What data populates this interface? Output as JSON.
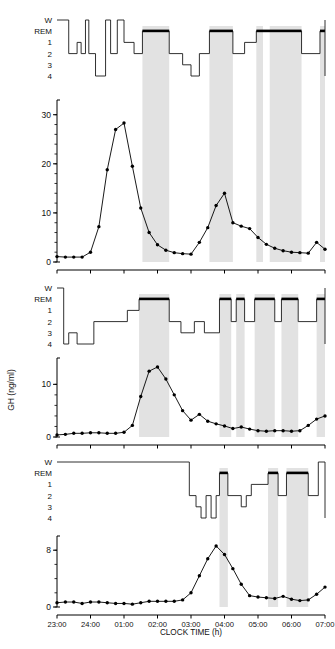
{
  "figure": {
    "xlabel": "CLOCK TIME (h)",
    "ylabel": "GH (ng/ml)",
    "x_ticks": [
      "23:00",
      "24:00",
      "01:00",
      "02:00",
      "03:00",
      "04:00",
      "05:00",
      "06:00",
      "07:00"
    ],
    "hypnogram_stage_labels": [
      "W",
      "REM",
      "1",
      "2",
      "3",
      "4"
    ],
    "colors": {
      "line": "#000000",
      "marker": "#000000",
      "rem_bar": "#000000",
      "rem_band": "#e2e2e2",
      "axis": "#000000"
    }
  },
  "chart_data": [
    {
      "type": "line",
      "title": "Subject 1 — GH and sleep stages",
      "panel": 1,
      "xlabel": "CLOCK TIME (h)",
      "ylabel": "GH (ng/ml)",
      "xlim": [
        23.0,
        31.0
      ],
      "ylim": [
        0,
        33
      ],
      "yticks": [
        0,
        10,
        20,
        30
      ],
      "ytick_labels": [
        "0",
        "10",
        "20",
        "30"
      ],
      "minor_ytick_step": 2,
      "grid": false,
      "legend": "none",
      "x": [
        23.0,
        23.25,
        23.5,
        23.75,
        24.0,
        24.25,
        24.5,
        24.75,
        25.0,
        25.25,
        25.5,
        25.75,
        26.0,
        26.25,
        26.5,
        26.75,
        27.0,
        27.25,
        27.5,
        27.75,
        28.0,
        28.25,
        28.5,
        28.75,
        29.0,
        29.25,
        29.5,
        29.75,
        30.0,
        30.25,
        30.5,
        30.75,
        31.0
      ],
      "values": [
        1.1,
        1.0,
        1.0,
        1.0,
        2.0,
        7.2,
        18.8,
        27.0,
        28.3,
        19.5,
        11.0,
        6.0,
        3.5,
        2.4,
        1.9,
        1.7,
        1.6,
        4.0,
        7.0,
        11.5,
        14.0,
        8.0,
        7.3,
        6.8,
        5.0,
        3.6,
        2.8,
        2.3,
        2.0,
        1.9,
        1.8,
        4.0,
        2.6
      ],
      "rem_bands": [
        [
          25.55,
          26.35
        ],
        [
          27.55,
          28.25
        ],
        [
          28.95,
          29.15
        ],
        [
          29.35,
          30.3
        ],
        [
          30.85,
          31.0
        ]
      ],
      "hypnogram": {
        "stages": [
          "W",
          "REM",
          "1",
          "2",
          "3",
          "4"
        ],
        "segments": [
          {
            "t0": 23.0,
            "t1": 23.35,
            "stage": "W"
          },
          {
            "t0": 23.35,
            "t1": 23.6,
            "stage": "2"
          },
          {
            "t0": 23.6,
            "t1": 23.72,
            "stage": "1"
          },
          {
            "t0": 23.72,
            "t1": 23.85,
            "stage": "2"
          },
          {
            "t0": 23.85,
            "t1": 23.95,
            "stage": "W"
          },
          {
            "t0": 23.95,
            "t1": 24.15,
            "stage": "2"
          },
          {
            "t0": 24.15,
            "t1": 24.45,
            "stage": "4"
          },
          {
            "t0": 24.45,
            "t1": 24.6,
            "stage": "W"
          },
          {
            "t0": 24.6,
            "t1": 24.8,
            "stage": "2"
          },
          {
            "t0": 24.8,
            "t1": 25.0,
            "stage": "W"
          },
          {
            "t0": 25.0,
            "t1": 25.3,
            "stage": "1"
          },
          {
            "t0": 25.3,
            "t1": 25.55,
            "stage": "2"
          },
          {
            "t0": 25.55,
            "t1": 26.35,
            "stage": "REM"
          },
          {
            "t0": 26.35,
            "t1": 26.75,
            "stage": "2"
          },
          {
            "t0": 26.75,
            "t1": 27.0,
            "stage": "3"
          },
          {
            "t0": 27.0,
            "t1": 27.25,
            "stage": "4"
          },
          {
            "t0": 27.25,
            "t1": 27.55,
            "stage": "2"
          },
          {
            "t0": 27.55,
            "t1": 28.25,
            "stage": "REM"
          },
          {
            "t0": 28.25,
            "t1": 28.6,
            "stage": "2"
          },
          {
            "t0": 28.6,
            "t1": 28.95,
            "stage": "1"
          },
          {
            "t0": 28.95,
            "t1": 30.3,
            "stage": "REM"
          },
          {
            "t0": 30.3,
            "t1": 30.85,
            "stage": "2"
          },
          {
            "t0": 30.85,
            "t1": 31.0,
            "stage": "REM"
          }
        ]
      }
    },
    {
      "type": "line",
      "title": "Subject 2 — GH and sleep stages",
      "panel": 2,
      "xlabel": "CLOCK TIME (h)",
      "ylabel": "GH (ng/ml)",
      "xlim": [
        23.0,
        31.0
      ],
      "ylim": [
        0,
        15
      ],
      "yticks": [
        0,
        10
      ],
      "ytick_labels": [
        "0",
        "10"
      ],
      "minor_ytick_step": 2,
      "grid": false,
      "legend": "none",
      "x": [
        23.0,
        23.25,
        23.5,
        23.75,
        24.0,
        24.25,
        24.5,
        24.75,
        25.0,
        25.25,
        25.5,
        25.75,
        26.0,
        26.25,
        26.5,
        26.75,
        27.0,
        27.25,
        27.5,
        27.75,
        28.0,
        28.25,
        28.5,
        28.75,
        29.0,
        29.25,
        29.5,
        29.75,
        30.0,
        30.25,
        30.5,
        30.75,
        31.0
      ],
      "values": [
        0.4,
        0.5,
        0.7,
        0.7,
        0.8,
        0.8,
        0.7,
        0.7,
        0.9,
        2.2,
        7.7,
        12.5,
        13.3,
        11.0,
        8.0,
        5.0,
        3.2,
        4.3,
        3.0,
        2.5,
        2.1,
        1.6,
        1.9,
        1.5,
        1.2,
        1.1,
        1.2,
        1.2,
        1.1,
        1.2,
        2.2,
        3.4,
        4.0
      ],
      "rem_bands": [
        [
          25.45,
          26.35
        ],
        [
          27.85,
          28.2
        ],
        [
          28.35,
          28.6
        ],
        [
          28.9,
          29.5
        ],
        [
          29.7,
          30.2
        ],
        [
          30.75,
          31.0
        ]
      ],
      "hypnogram": {
        "stages": [
          "W",
          "REM",
          "1",
          "2",
          "3",
          "4"
        ],
        "segments": [
          {
            "t0": 23.0,
            "t1": 23.2,
            "stage": "W"
          },
          {
            "t0": 23.2,
            "t1": 23.35,
            "stage": "4"
          },
          {
            "t0": 23.35,
            "t1": 23.6,
            "stage": "3"
          },
          {
            "t0": 23.6,
            "t1": 24.1,
            "stage": "4"
          },
          {
            "t0": 24.1,
            "t1": 25.1,
            "stage": "2"
          },
          {
            "t0": 25.1,
            "t1": 25.45,
            "stage": "1"
          },
          {
            "t0": 25.45,
            "t1": 26.35,
            "stage": "REM"
          },
          {
            "t0": 26.35,
            "t1": 26.7,
            "stage": "2"
          },
          {
            "t0": 26.7,
            "t1": 27.1,
            "stage": "3"
          },
          {
            "t0": 27.1,
            "t1": 27.4,
            "stage": "2"
          },
          {
            "t0": 27.4,
            "t1": 27.85,
            "stage": "3"
          },
          {
            "t0": 27.85,
            "t1": 28.2,
            "stage": "REM"
          },
          {
            "t0": 28.2,
            "t1": 28.35,
            "stage": "2"
          },
          {
            "t0": 28.35,
            "t1": 28.6,
            "stage": "REM"
          },
          {
            "t0": 28.6,
            "t1": 28.9,
            "stage": "2"
          },
          {
            "t0": 28.9,
            "t1": 29.5,
            "stage": "REM"
          },
          {
            "t0": 29.5,
            "t1": 29.7,
            "stage": "2"
          },
          {
            "t0": 29.7,
            "t1": 30.2,
            "stage": "REM"
          },
          {
            "t0": 30.2,
            "t1": 30.75,
            "stage": "2"
          },
          {
            "t0": 30.75,
            "t1": 31.0,
            "stage": "REM"
          }
        ]
      }
    },
    {
      "type": "line",
      "title": "Subject 3 — GH and sleep stages (delayed sleep)",
      "panel": 3,
      "xlabel": "CLOCK TIME (h)",
      "ylabel": "GH (ng/ml)",
      "xlim": [
        23.0,
        31.0
      ],
      "ylim": [
        0,
        10
      ],
      "yticks": [
        0,
        8
      ],
      "ytick_labels": [
        "0",
        "8"
      ],
      "minor_ytick_step": 2,
      "grid": false,
      "legend": "none",
      "x": [
        23.0,
        23.25,
        23.5,
        23.75,
        24.0,
        24.25,
        24.5,
        24.75,
        25.0,
        25.25,
        25.5,
        25.75,
        26.0,
        26.25,
        26.5,
        26.75,
        27.0,
        27.25,
        27.5,
        27.75,
        28.0,
        28.25,
        28.5,
        28.75,
        29.0,
        29.25,
        29.5,
        29.75,
        30.0,
        30.25,
        30.5,
        30.75,
        31.0
      ],
      "values": [
        0.6,
        0.7,
        0.7,
        0.5,
        0.7,
        0.7,
        0.6,
        0.5,
        0.5,
        0.4,
        0.6,
        0.8,
        0.8,
        0.8,
        0.8,
        1.0,
        2.0,
        4.4,
        6.8,
        8.6,
        7.4,
        5.4,
        3.2,
        1.6,
        1.4,
        1.3,
        1.2,
        1.5,
        1.1,
        0.9,
        1.0,
        1.8,
        2.8
      ],
      "rem_bands": [
        [
          27.85,
          28.1
        ],
        [
          29.3,
          29.6
        ],
        [
          29.85,
          30.5
        ]
      ],
      "hypnogram": {
        "stages": [
          "W",
          "REM",
          "1",
          "2",
          "3",
          "4"
        ],
        "segments": [
          {
            "t0": 23.0,
            "t1": 26.95,
            "stage": "W"
          },
          {
            "t0": 26.95,
            "t1": 27.15,
            "stage": "2"
          },
          {
            "t0": 27.15,
            "t1": 27.3,
            "stage": "3"
          },
          {
            "t0": 27.3,
            "t1": 27.45,
            "stage": "4"
          },
          {
            "t0": 27.45,
            "t1": 27.6,
            "stage": "2"
          },
          {
            "t0": 27.6,
            "t1": 27.75,
            "stage": "4"
          },
          {
            "t0": 27.75,
            "t1": 27.85,
            "stage": "2"
          },
          {
            "t0": 27.85,
            "t1": 28.1,
            "stage": "REM"
          },
          {
            "t0": 28.1,
            "t1": 28.5,
            "stage": "2"
          },
          {
            "t0": 28.5,
            "t1": 28.65,
            "stage": "3"
          },
          {
            "t0": 28.65,
            "t1": 28.8,
            "stage": "2"
          },
          {
            "t0": 28.8,
            "t1": 29.3,
            "stage": "1"
          },
          {
            "t0": 29.3,
            "t1": 29.6,
            "stage": "REM"
          },
          {
            "t0": 29.6,
            "t1": 29.85,
            "stage": "2"
          },
          {
            "t0": 29.85,
            "t1": 30.5,
            "stage": "REM"
          },
          {
            "t0": 30.5,
            "t1": 30.8,
            "stage": "2"
          },
          {
            "t0": 30.8,
            "t1": 31.0,
            "stage": "W"
          }
        ]
      }
    }
  ]
}
